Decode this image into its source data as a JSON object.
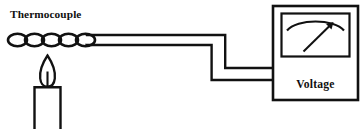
{
  "figure": {
    "width": 363,
    "height": 129,
    "background_color": "#ffffff",
    "ink_color": "#111111"
  },
  "labels": {
    "thermocouple": "Thermocouple",
    "voltage": "Voltage"
  },
  "components": {
    "coil": {
      "name": "thermocouple-coil",
      "loop_count": 5,
      "description": "coiled thermocouple junction wire"
    },
    "lead_wire": {
      "name": "twin-lead-wire",
      "conductor_count": 2,
      "description": "two parallel leads running right then stepping down to the meter"
    },
    "candle": {
      "name": "candle",
      "description": "lit candle heating the thermocouple junction",
      "flame": "teardrop flame with wick"
    },
    "meter": {
      "name": "voltmeter",
      "description": "analog panel meter with arc scale and needle",
      "needle_direction": "up-right",
      "scale_type": "arc"
    }
  }
}
